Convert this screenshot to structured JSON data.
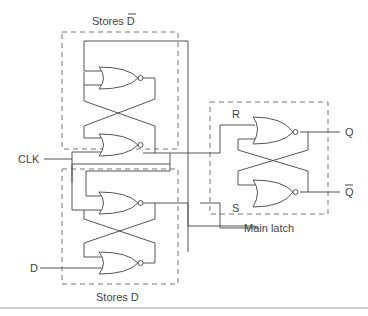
{
  "diagram": {
    "blocks": {
      "top": {
        "label": "Stores D",
        "overline": "D"
      },
      "bottom": {
        "label": "Stores D"
      },
      "main": {
        "label": "Main latch"
      }
    },
    "inputs": {
      "clk": "CLK",
      "d": "D"
    },
    "latch_inputs": {
      "r": "R",
      "s": "S"
    },
    "outputs": {
      "q": "Q",
      "q_bar": "Q"
    },
    "colors": {
      "wire": "#555555",
      "box": "#777777",
      "text": "#444444"
    }
  }
}
